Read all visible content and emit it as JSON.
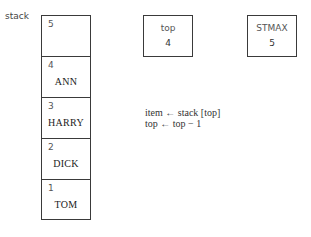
{
  "stack": {
    "label": "stack",
    "cells": [
      {
        "index": "5",
        "value": ""
      },
      {
        "index": "4",
        "value": "ANN"
      },
      {
        "index": "3",
        "value": "HARRY"
      },
      {
        "index": "2",
        "value": "DICK"
      },
      {
        "index": "1",
        "value": "TOM"
      }
    ]
  },
  "variables": [
    {
      "name": "top",
      "value": "4"
    },
    {
      "name": "STMAX",
      "value": "5"
    }
  ],
  "code": [
    "item ← stack [top]",
    "top ← top − 1"
  ]
}
